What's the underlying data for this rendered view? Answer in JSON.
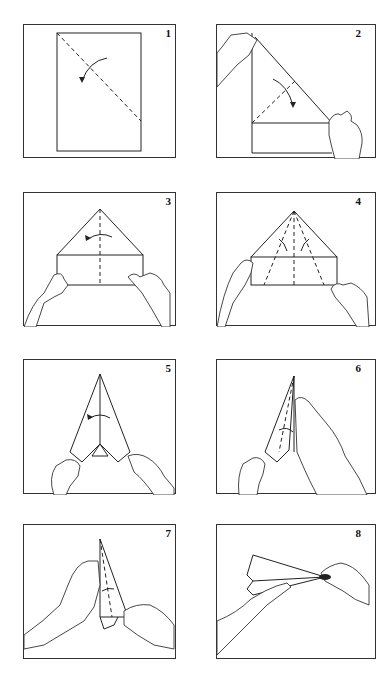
{
  "steps": [
    {
      "number": "1",
      "description": "Fold the sheet diagonally along the dashed line"
    },
    {
      "number": "2",
      "description": "Fold the top edge down to form a triangle"
    },
    {
      "number": "3",
      "description": "Fold along center line"
    },
    {
      "number": "4",
      "description": "Fold both sides toward the center"
    },
    {
      "number": "5",
      "description": "Fold in half along center"
    },
    {
      "number": "6",
      "description": "Fold wing down"
    },
    {
      "number": "7",
      "description": "Fold second wing"
    },
    {
      "number": "8",
      "description": "Hold and throw the airplane"
    }
  ],
  "colors": {
    "line": "#222222",
    "background": "#ffffff"
  }
}
